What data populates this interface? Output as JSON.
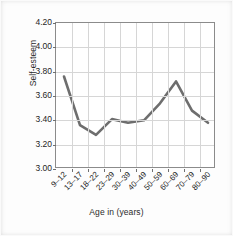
{
  "chart_data": {
    "type": "line",
    "title": "",
    "xlabel": "Age in (years)",
    "ylabel": "Self-esteem",
    "categories": [
      "9–12",
      "13–17",
      "18–22",
      "23–29",
      "30–39",
      "40–49",
      "50–59",
      "60–69",
      "70–79",
      "80–90"
    ],
    "values": [
      3.76,
      3.36,
      3.28,
      3.41,
      3.38,
      3.4,
      3.54,
      3.72,
      3.48,
      3.38
    ],
    "series": [
      {
        "name": "Self-esteem",
        "values": [
          3.76,
          3.36,
          3.28,
          3.41,
          3.38,
          3.4,
          3.54,
          3.72,
          3.48,
          3.38
        ]
      }
    ],
    "ylim": [
      3.0,
      4.2
    ],
    "yticks": [
      "3.00",
      "3.20",
      "3.40",
      "3.60",
      "3.80",
      "4.00",
      "4.20"
    ],
    "ytick_values": [
      3.0,
      3.2,
      3.4,
      3.6,
      3.8,
      4.0,
      4.2
    ],
    "grid": true,
    "legend": "none",
    "line_color": "#6e6e6e",
    "grid_color": "#d6d6d6",
    "axis_color": "#8b8b8b",
    "background_color": "#ffffff"
  }
}
